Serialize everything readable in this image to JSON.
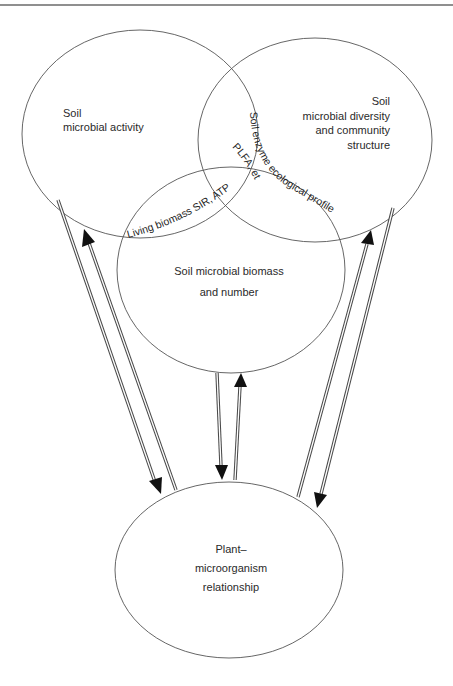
{
  "diagram": {
    "type": "venn-with-feedback-arrows",
    "nodes": {
      "activity": {
        "lines": [
          "Soil",
          "microbial activity"
        ],
        "shape": {
          "cx": 140,
          "cy": 134,
          "rx": 118,
          "ry": 104
        }
      },
      "diversity": {
        "lines": [
          "Soil",
          "microbial diversity",
          "and community",
          "structure"
        ],
        "shape": {
          "cx": 315,
          "cy": 140,
          "rx": 117,
          "ry": 102
        }
      },
      "biomass": {
        "lines": [
          "Soil microbial biomass",
          "and number"
        ],
        "shape": {
          "cx": 231,
          "cy": 270,
          "rx": 114,
          "ry": 103
        }
      },
      "plant": {
        "lines": [
          "Plant–",
          "microorganism",
          "relationship"
        ],
        "shape": {
          "cx": 229,
          "cy": 570,
          "rx": 114,
          "ry": 88
        }
      }
    },
    "overlap_labels": {
      "activity_biomass": "Living biomass SIR, ATP",
      "diversity_biomass": "Soil enzyme ecological profile",
      "center": "PLFA, etc."
    },
    "arrows": [
      {
        "from": "activity",
        "to": "plant",
        "direction": "down"
      },
      {
        "from": "plant",
        "to": "activity",
        "direction": "up"
      },
      {
        "from": "biomass",
        "to": "plant",
        "direction": "down"
      },
      {
        "from": "plant",
        "to": "biomass",
        "direction": "up"
      },
      {
        "from": "plant",
        "to": "diversity",
        "direction": "up"
      },
      {
        "from": "diversity",
        "to": "plant",
        "direction": "down"
      }
    ],
    "colors": {
      "outline": "#555555",
      "text": "#2a2a2a",
      "arrow": "#111111",
      "background": "#ffffff"
    }
  }
}
